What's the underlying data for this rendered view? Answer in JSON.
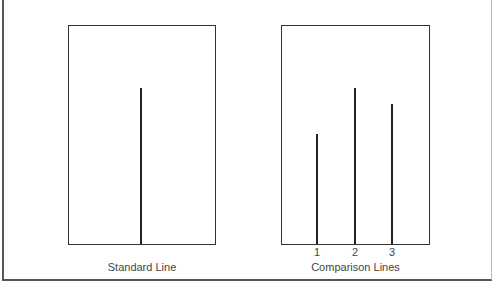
{
  "diagram": {
    "type": "line-length comparison (Asch conformity task)",
    "standard_panel": {
      "caption": "Standard Line",
      "line": {
        "relative_height": 0.71
      }
    },
    "comparison_panel": {
      "caption": "Comparison Lines",
      "lines": [
        {
          "label": "1",
          "relative_height": 0.5
        },
        {
          "label": "2",
          "relative_height": 0.71
        },
        {
          "label": "3",
          "relative_height": 0.64
        }
      ]
    },
    "colors": {
      "stroke": "#222222",
      "border": "#333333",
      "text": "#444444",
      "background": "#ffffff"
    }
  }
}
